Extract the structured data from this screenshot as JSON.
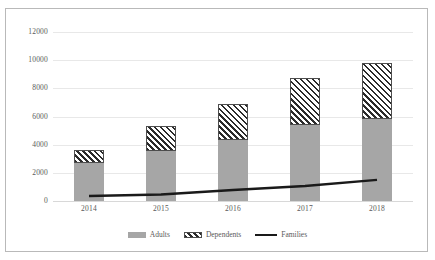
{
  "chart_data": {
    "type": "bar",
    "stacked": true,
    "title": "",
    "xlabel": "",
    "ylabel": "",
    "categories": [
      "2014",
      "2015",
      "2016",
      "2017",
      "2018"
    ],
    "ylim": [
      0,
      12000
    ],
    "yticks": [
      0,
      2000,
      4000,
      6000,
      8000,
      10000,
      12000
    ],
    "ytick_labels": [
      "0",
      "2000",
      "4000",
      "6000",
      "8000",
      "10000",
      "12000"
    ],
    "grid": true,
    "legend_position": "bottom",
    "series": [
      {
        "name": "Adults",
        "type": "bar",
        "style": "solid-gray",
        "color": "#A6A6A6",
        "values": [
          2700,
          3550,
          4300,
          5400,
          5800
        ]
      },
      {
        "name": "Dependents",
        "type": "bar",
        "style": "diagonal-hatch",
        "color": "#FFFFFF",
        "values": [
          900,
          1750,
          2600,
          3300,
          4000
        ]
      },
      {
        "name": "Families",
        "type": "line",
        "style": "solid-black-line",
        "color": "#1A1A1A",
        "values": [
          350,
          460,
          780,
          1060,
          1500
        ]
      }
    ],
    "stack_totals": [
      3600,
      5300,
      6900,
      8700,
      9800
    ]
  },
  "legend": {
    "items": [
      {
        "label": "Adults",
        "marker": "gray-square-swatch"
      },
      {
        "label": "Dependents",
        "marker": "hatched-square-swatch"
      },
      {
        "label": "Families",
        "marker": "black-line-swatch"
      }
    ]
  },
  "colors": {
    "adults": "#A6A6A6",
    "dependents_hatch": "#2B2B2B",
    "families_line": "#1A1A1A",
    "gridline": "#E8E8E8",
    "border": "#B9B9B9",
    "text": "#595959"
  }
}
